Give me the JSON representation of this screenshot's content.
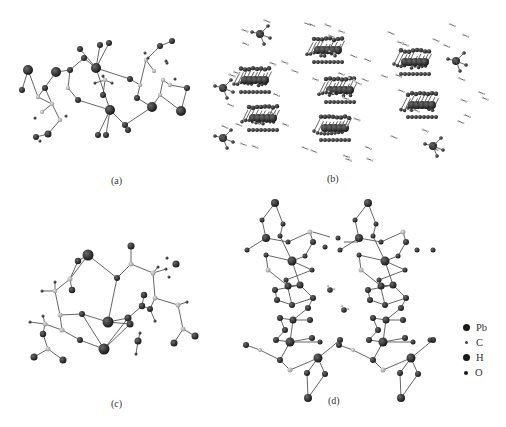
{
  "figure": {
    "panels": [
      {
        "id": "a",
        "caption": "(a)",
        "description": "Molecular unit (ball-and-stick)"
      },
      {
        "id": "b",
        "caption": "(b)",
        "description": "Crystal packing view"
      },
      {
        "id": "c",
        "caption": "(c)",
        "description": "Asymmetric unit with coordination"
      },
      {
        "id": "d",
        "caption": "(d)",
        "description": "Chain structure view"
      }
    ],
    "legend": {
      "items": [
        {
          "label": "Pb",
          "symbol": "large-dark-sphere"
        },
        {
          "label": "C",
          "symbol": "tiny-grey-sphere"
        },
        {
          "label": "H",
          "symbol": "medium-dark-sphere"
        },
        {
          "label": "O",
          "symbol": "small-dark-sphere"
        }
      ]
    },
    "colors": {
      "atom_dark": "#1a1a1a",
      "atom_grey": "#9a9a9a",
      "bond": "#555555",
      "background": "#ffffff"
    }
  }
}
